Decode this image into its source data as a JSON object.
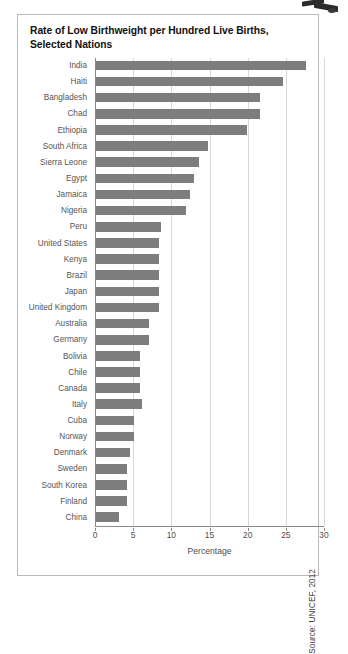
{
  "figure": {
    "title": "Rate of Low Birthweight per Hundred Live Births, Selected Nations",
    "source": "Source: UNICEF, 2012",
    "bar_color": "#7d7d7d",
    "grid_color": "#d8d8d8",
    "axis_color": "#8a8a8a",
    "border_color": "#b9b9b9"
  },
  "chart_data": {
    "type": "bar",
    "orientation": "horizontal",
    "title": "Rate of Low Birthweight per Hundred Live Births, Selected Nations",
    "xlabel": "Percentage",
    "ylabel": "",
    "xlim": [
      0,
      30
    ],
    "xticks": [
      0,
      5,
      10,
      15,
      20,
      25,
      30
    ],
    "xtick_labels": [
      "0",
      "5",
      "10",
      "15",
      "20",
      "25",
      "30"
    ],
    "grid": true,
    "legend": null,
    "source": "Source: UNICEF, 2012",
    "categories": [
      "India",
      "Haiti",
      "Bangladesh",
      "Chad",
      "Ethiopia",
      "South Africa",
      "Sierra Leone",
      "Egypt",
      "Jamaica",
      "Nigeria",
      "Peru",
      "United States",
      "Kenya",
      "Brazil",
      "Japan",
      "United Kingdom",
      "Australia",
      "Germany",
      "Bolivia",
      "Chile",
      "Canada",
      "Italy",
      "Cuba",
      "Norway",
      "Denmark",
      "Sweden",
      "South Korea",
      "Finland",
      "China"
    ],
    "values": [
      27.5,
      24.5,
      21.5,
      21.5,
      19.8,
      14.7,
      13.5,
      12.8,
      12.3,
      11.8,
      8.5,
      8.3,
      8.3,
      8.3,
      8.3,
      8.3,
      7.0,
      7.0,
      5.8,
      5.8,
      5.8,
      6.0,
      5.0,
      5.0,
      4.5,
      4.0,
      4.0,
      4.0,
      3.0
    ],
    "units": "percent"
  }
}
